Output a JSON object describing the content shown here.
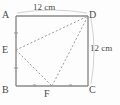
{
  "figure": {
    "shape": "square",
    "colors": {
      "stroke": "#8a8a8a",
      "dashed_stroke": "#9a9a9a",
      "text": "#4a4a4a",
      "background": "#fdfdfd",
      "arc": "#cfcfcf"
    },
    "vertices": {
      "A": "A",
      "B": "B",
      "C": "C",
      "D": "D",
      "E": "E",
      "F": "F"
    },
    "dimensions": {
      "top": "12 cm",
      "right": "12 cm"
    },
    "geometry": {
      "square": {
        "left": 16,
        "top": 16,
        "right": 88,
        "bottom": 86
      },
      "points": {
        "A": [
          16,
          16
        ],
        "D": [
          88,
          16
        ],
        "B": [
          16,
          86
        ],
        "C": [
          88,
          86
        ],
        "E": [
          16,
          50
        ],
        "F": [
          52,
          86
        ]
      },
      "dashed_segments": [
        [
          "E",
          "D"
        ],
        [
          "E",
          "F"
        ],
        [
          "F",
          "D"
        ]
      ],
      "tick_marks": [
        {
          "side": "AE",
          "x": 16,
          "y": 33
        },
        {
          "side": "EB",
          "x": 16,
          "y": 68
        },
        {
          "side": "BF",
          "x": 34,
          "y": 86
        },
        {
          "side": "FC",
          "x": 70,
          "y": 86
        }
      ]
    }
  }
}
